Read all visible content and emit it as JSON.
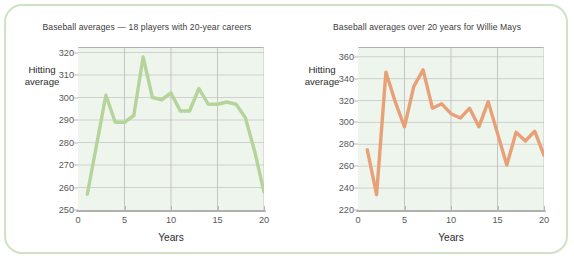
{
  "figure": {
    "frame_color": "#cfe3c4",
    "background": "#ffffff"
  },
  "chart_data": [
    {
      "panel": "left",
      "type": "line",
      "title": "Baseball averages — 18 players with 20-year careers",
      "xlabel": "Years",
      "ylabel": "Hitting\naverage",
      "ylabel_line1": "Hitting",
      "ylabel_line2": "average",
      "grid": true,
      "legend": "none",
      "series_color": "#b5d49a",
      "plot_background": "#eef5ec",
      "xlim": [
        0,
        20
      ],
      "ylim": [
        250,
        322
      ],
      "xticks": [
        0,
        5,
        10,
        15,
        20
      ],
      "yticks": [
        250,
        260,
        270,
        280,
        290,
        300,
        310,
        320
      ],
      "x": [
        1,
        2,
        3,
        4,
        5,
        6,
        7,
        8,
        9,
        10,
        11,
        12,
        13,
        14,
        15,
        16,
        17,
        18,
        19,
        20
      ],
      "values": [
        257,
        279,
        301,
        289,
        289,
        292,
        318,
        300,
        299,
        302,
        294,
        294,
        304,
        297,
        297,
        298,
        297,
        291,
        276,
        258
      ]
    },
    {
      "panel": "right",
      "type": "line",
      "title": "Baseball averages over 20 years for Willie Mays",
      "xlabel": "Years",
      "ylabel": "Hitting\naverage",
      "ylabel_line1": "Hitting",
      "ylabel_line2": "average",
      "grid": true,
      "legend": "none",
      "series_color": "#e8a077",
      "plot_background": "#eef5ec",
      "xlim": [
        0,
        20
      ],
      "ylim": [
        220,
        368
      ],
      "xticks": [
        0,
        5,
        10,
        15,
        20
      ],
      "yticks": [
        220,
        240,
        260,
        280,
        300,
        320,
        340,
        360
      ],
      "x": [
        1,
        2,
        3,
        4,
        5,
        6,
        7,
        8,
        9,
        10,
        11,
        12,
        13,
        14,
        15,
        16,
        17,
        18,
        19,
        20
      ],
      "values": [
        275,
        234,
        346,
        319,
        296,
        333,
        348,
        313,
        317,
        308,
        304,
        313,
        296,
        319,
        290,
        261,
        291,
        283,
        292,
        270
      ]
    }
  ]
}
